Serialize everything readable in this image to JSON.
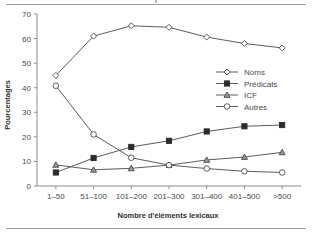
{
  "chart_data": {
    "type": "line",
    "title": "",
    "xlabel": "Nombre d'éléments lexicaux",
    "ylabel": "Pourcentages",
    "categories": [
      "1–50",
      "51–100",
      "101–200",
      "201–300",
      "301–400",
      "401–500",
      ">500"
    ],
    "ylim": [
      0,
      70
    ],
    "yticks": [
      0,
      10,
      20,
      30,
      40,
      50,
      60,
      70
    ],
    "ytick_labels": [
      "0",
      "10",
      "20",
      "30",
      "40",
      "50",
      "60",
      "70"
    ],
    "grid": false,
    "legend_position": "inside-right",
    "series": [
      {
        "name": "Noms",
        "marker": "open-diamond",
        "color": "#4a4a4a",
        "values": [
          45.0,
          61.0,
          65.2,
          64.6,
          60.6,
          58.0,
          56.2
        ]
      },
      {
        "name": "Prédicats",
        "marker": "filled-square",
        "color": "#2b2b2b",
        "values": [
          5.5,
          11.4,
          15.9,
          18.4,
          22.2,
          24.3,
          24.8
        ]
      },
      {
        "name": "ICF",
        "marker": "shaded-triangle",
        "color": "#9a9a9a",
        "values": [
          8.6,
          6.6,
          7.2,
          8.5,
          10.6,
          11.8,
          13.7
        ]
      },
      {
        "name": "Autres",
        "marker": "open-circle",
        "color": "#4a4a4a",
        "values": [
          40.8,
          21.0,
          11.5,
          8.5,
          7.1,
          6.0,
          5.5
        ]
      }
    ]
  }
}
